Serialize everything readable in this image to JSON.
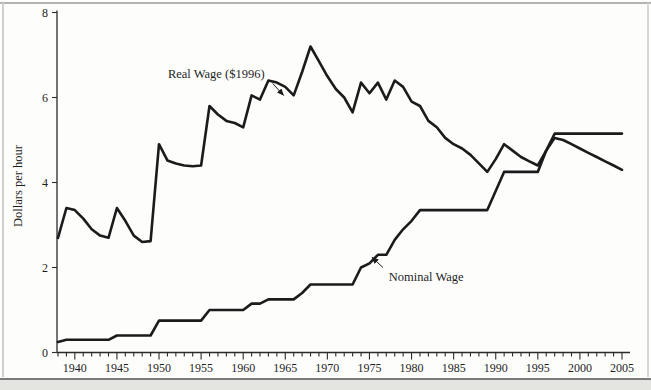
{
  "figure": {
    "ylabel": "Dollars per hour",
    "ink_color": "#1b1b1b",
    "axis_color": "#2b2b2b"
  },
  "chart_data": {
    "type": "line",
    "title": "",
    "xlabel": "",
    "ylabel": "Dollars per hour",
    "xlim": [
      1938,
      2005
    ],
    "ylim": [
      0,
      8
    ],
    "grid": false,
    "legend": "inline-annotations",
    "y_ticks": [
      0,
      2,
      4,
      6,
      8
    ],
    "x_major_ticks": [
      1940,
      1945,
      1950,
      1955,
      1960,
      1965,
      1970,
      1975,
      1980,
      1985,
      1990,
      1995,
      2000,
      2005
    ],
    "x": [
      1938,
      1939,
      1940,
      1941,
      1942,
      1943,
      1944,
      1945,
      1946,
      1947,
      1948,
      1949,
      1950,
      1951,
      1952,
      1953,
      1954,
      1955,
      1956,
      1957,
      1958,
      1959,
      1960,
      1961,
      1962,
      1963,
      1964,
      1965,
      1966,
      1967,
      1968,
      1969,
      1970,
      1971,
      1972,
      1973,
      1974,
      1975,
      1976,
      1977,
      1978,
      1979,
      1980,
      1981,
      1982,
      1983,
      1984,
      1985,
      1986,
      1987,
      1988,
      1989,
      1990,
      1991,
      1992,
      1993,
      1994,
      1995,
      1996,
      1997,
      1998,
      1999,
      2000,
      2001,
      2002,
      2003,
      2004,
      2005
    ],
    "series": [
      {
        "key": "real-wage",
        "name": "Real Wage ($1996)",
        "values": [
          2.7,
          3.4,
          3.35,
          3.15,
          2.9,
          2.75,
          2.7,
          3.4,
          3.1,
          2.75,
          2.6,
          2.62,
          4.9,
          4.52,
          4.45,
          4.4,
          4.38,
          4.4,
          5.8,
          5.6,
          5.45,
          5.4,
          5.3,
          6.05,
          5.95,
          6.4,
          6.35,
          6.25,
          6.05,
          6.6,
          7.2,
          6.85,
          6.5,
          6.2,
          6.0,
          5.65,
          6.35,
          6.1,
          6.35,
          5.95,
          6.4,
          6.25,
          5.9,
          5.8,
          5.45,
          5.3,
          5.05,
          4.9,
          4.8,
          4.65,
          4.45,
          4.25,
          4.55,
          4.9,
          4.75,
          4.6,
          4.5,
          4.4,
          4.75,
          5.05,
          5.0,
          4.9,
          4.8,
          4.7,
          4.6,
          4.5,
          4.4,
          4.3
        ]
      },
      {
        "key": "nominal-wage",
        "name": "Nominal Wage",
        "values": [
          0.25,
          0.3,
          0.3,
          0.3,
          0.3,
          0.3,
          0.3,
          0.4,
          0.4,
          0.4,
          0.4,
          0.4,
          0.75,
          0.75,
          0.75,
          0.75,
          0.75,
          0.75,
          1.0,
          1.0,
          1.0,
          1.0,
          1.0,
          1.15,
          1.15,
          1.25,
          1.25,
          1.25,
          1.25,
          1.4,
          1.6,
          1.6,
          1.6,
          1.6,
          1.6,
          1.6,
          2.0,
          2.1,
          2.3,
          2.3,
          2.65,
          2.9,
          3.1,
          3.35,
          3.35,
          3.35,
          3.35,
          3.35,
          3.35,
          3.35,
          3.35,
          3.35,
          3.8,
          4.25,
          4.25,
          4.25,
          4.25,
          4.25,
          4.75,
          5.15,
          5.15,
          5.15,
          5.15,
          5.15,
          5.15,
          5.15,
          5.15,
          5.15
        ]
      }
    ],
    "annotations": [
      {
        "key": "real-wage",
        "text": "Real Wage ($1996)",
        "text_at": [
          1956.8,
          6.57
        ],
        "align": "middle",
        "arrow_from": [
          1963.5,
          6.33
        ],
        "arrow_to": [
          1964.8,
          6.05
        ]
      },
      {
        "key": "nominal-wage",
        "text": "Nominal Wage",
        "text_at": [
          1977.3,
          1.8
        ],
        "align": "start",
        "arrow_from": [
          1976.6,
          2.0
        ],
        "arrow_to": [
          1975.3,
          2.24
        ]
      }
    ],
    "line_color": "#1b1b1b"
  }
}
